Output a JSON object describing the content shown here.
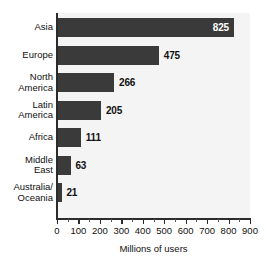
{
  "chart_data": {
    "type": "bar",
    "orientation": "horizontal",
    "title": "",
    "xlabel": "Millions of users",
    "ylabel": "",
    "categories": [
      "Asia",
      "Europe",
      "North America",
      "Latin America",
      "Africa",
      "Middle East",
      "Australia/ Oceania"
    ],
    "category_lines": [
      [
        "Asia"
      ],
      [
        "Europe"
      ],
      [
        "North",
        "America"
      ],
      [
        "Latin",
        "America"
      ],
      [
        "Africa"
      ],
      [
        "Middle",
        "East"
      ],
      [
        "Australia/",
        "Oceania"
      ]
    ],
    "values": [
      825,
      475,
      266,
      205,
      111,
      63,
      21
    ],
    "value_labels": [
      "825",
      "475",
      "266",
      "205",
      "111",
      "63",
      "21"
    ],
    "label_placement": [
      "inside",
      "outside",
      "outside",
      "outside",
      "outside",
      "outside",
      "outside"
    ],
    "xlim": [
      0,
      900
    ],
    "xticks": [
      0,
      100,
      200,
      300,
      400,
      500,
      600,
      700,
      800,
      900
    ],
    "xtick_labels": [
      "0",
      "100",
      "200",
      "300",
      "400",
      "500",
      "600",
      "700",
      "800",
      "900"
    ],
    "minor_tick_step": 50,
    "grid": false,
    "legend": null,
    "bar_color": "#3a3a3a",
    "plot_background": "#f4f4f4",
    "axis_color": "#2b2b2b",
    "inside_label_color": "#ffffff",
    "outside_label_color": "#111111"
  }
}
